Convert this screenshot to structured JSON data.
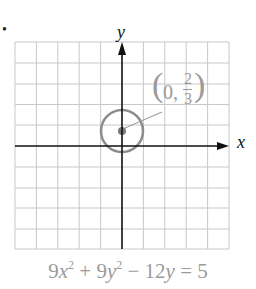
{
  "problem_bullet": "•",
  "graph": {
    "x_axis_label": "x",
    "y_axis_label": "y",
    "grid": {
      "columns": 10,
      "rows": 10,
      "color": "#c8c8c8"
    },
    "axis_color": "#111111",
    "circle": {
      "center": "(0, 2/3)",
      "radius": "1",
      "color": "#8c8c8c"
    },
    "annotation": {
      "open": "(",
      "x": "0,",
      "num": "2",
      "den": "3",
      "close": ")"
    }
  },
  "equation": {
    "a": "9",
    "x": "x",
    "b": " + 9",
    "y": "y",
    "c": " − 12",
    "y2": "y",
    "d": " = 5",
    "exp": "2"
  }
}
